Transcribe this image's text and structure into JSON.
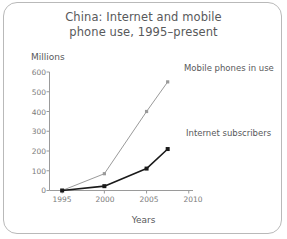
{
  "figure": {
    "title_lines": [
      "China: Internet and mobile",
      "phone use, 1995–present"
    ],
    "border_color": "#b9b9b9",
    "background": "#ffffff",
    "text_color": "#58595b"
  },
  "chart_data": {
    "type": "line",
    "title": "China: Internet and mobile phone use, 1995–present",
    "xlabel": "Years",
    "ylabel": "Millions",
    "xlim": [
      1993.5,
      2010.5
    ],
    "ylim": [
      0,
      600
    ],
    "grid": false,
    "legend_position": "inline-right",
    "xticks": [
      "1995",
      "2000",
      "2005",
      "2010"
    ],
    "xtick_values": [
      1995,
      2000,
      2005,
      2010
    ],
    "yticks": [
      "0",
      "100",
      "200",
      "300",
      "400",
      "500",
      "600"
    ],
    "ytick_values": [
      0,
      100,
      200,
      300,
      400,
      500,
      600
    ],
    "series": [
      {
        "name": "Mobile phones in use",
        "color": "#9a9a9a",
        "marker": "square",
        "x": [
          1995,
          2000,
          2005,
          2007.5
        ],
        "values": [
          0,
          85,
          400,
          550
        ]
      },
      {
        "name": "Internet subscribers",
        "color": "#1a1a1a",
        "marker": "square",
        "x": [
          1995,
          2000,
          2005,
          2007.5
        ],
        "values": [
          0,
          22,
          111,
          210
        ]
      }
    ]
  }
}
